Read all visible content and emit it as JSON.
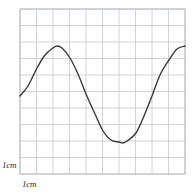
{
  "figure": {
    "name": "graph-paper-sine-curve",
    "background_color": "#ffffff"
  },
  "labels": {
    "vertical_scale": "1cm",
    "horizontal_scale": "1cm"
  },
  "chart_data": {
    "type": "line",
    "title": "",
    "subtitle": "",
    "xlabel": "",
    "ylabel": "",
    "grid": {
      "visible": true,
      "columns": 10,
      "rows": 10,
      "cell_size_cm": 1,
      "cell_size_px": 16.5,
      "left_px": 20,
      "top_px": 9,
      "right_px": 185,
      "bottom_px": 174,
      "line_color": "#c9cdd4",
      "border_color": "#b6bac1"
    },
    "axes": {
      "xlim_cm": [
        0,
        10
      ],
      "ylim_cm": [
        0,
        10
      ],
      "x_tick_labels": [],
      "y_tick_labels": []
    },
    "legend": {
      "visible": false,
      "position": "none",
      "entries": []
    },
    "annotations": [
      {
        "text": "1cm",
        "role": "vertical-scale-bar",
        "x_px": 2,
        "y_px": 161
      },
      {
        "text": "1cm",
        "role": "horizontal-scale-bar",
        "x_px": 22,
        "y_px": 180
      }
    ],
    "series": [
      {
        "name": "sine curve",
        "color": "#3a3a3a",
        "line_width_px": 1.4,
        "smooth": true,
        "amplitude_cm": 2.85,
        "midline_cm": 5.2,
        "period_cm": 8.0,
        "x_cm": [
          0.0,
          0.5,
          1.0,
          1.5,
          2.0,
          2.25,
          2.5,
          3.0,
          3.5,
          4.0,
          4.5,
          5.0,
          5.5,
          6.0,
          6.25,
          6.5,
          7.0,
          7.5,
          8.0,
          8.5,
          9.0,
          9.5,
          10.0
        ],
        "y_cm": [
          4.65,
          5.85,
          6.95,
          7.75,
          8.0,
          8.05,
          7.95,
          7.35,
          6.35,
          5.15,
          3.9,
          2.9,
          2.35,
          2.2,
          2.15,
          2.25,
          2.75,
          3.75,
          5.0,
          6.25,
          7.2,
          7.85,
          8.05
        ],
        "points_px": [
          {
            "x": 20,
            "y": 96
          },
          {
            "x": 28,
            "y": 86
          },
          {
            "x": 37,
            "y": 68
          },
          {
            "x": 45,
            "y": 55
          },
          {
            "x": 53,
            "y": 48
          },
          {
            "x": 57,
            "y": 46
          },
          {
            "x": 62,
            "y": 48
          },
          {
            "x": 70,
            "y": 58
          },
          {
            "x": 78,
            "y": 74
          },
          {
            "x": 86,
            "y": 94
          },
          {
            "x": 95,
            "y": 114
          },
          {
            "x": 103,
            "y": 131
          },
          {
            "x": 111,
            "y": 140
          },
          {
            "x": 119,
            "y": 142
          },
          {
            "x": 123,
            "y": 143
          },
          {
            "x": 127,
            "y": 141
          },
          {
            "x": 136,
            "y": 133
          },
          {
            "x": 144,
            "y": 116
          },
          {
            "x": 152,
            "y": 96
          },
          {
            "x": 160,
            "y": 75
          },
          {
            "x": 169,
            "y": 60
          },
          {
            "x": 177,
            "y": 49
          },
          {
            "x": 185,
            "y": 46
          }
        ]
      }
    ]
  }
}
